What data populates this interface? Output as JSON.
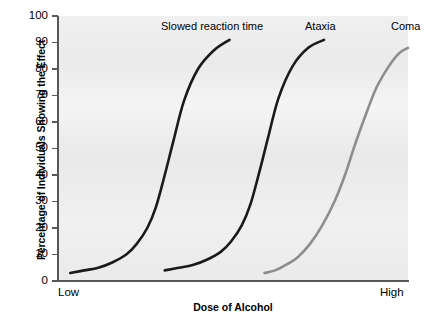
{
  "chart_data": {
    "type": "line",
    "title": "",
    "xlabel": "Dose of Alcohol",
    "ylabel": "Percentage of Individuals Showing the Effect",
    "xlim": [
      "Low",
      "High"
    ],
    "ylim": [
      0,
      100
    ],
    "grid": false,
    "legend_position": "inline-above-curves",
    "y_ticks": [
      0,
      10,
      20,
      30,
      40,
      50,
      60,
      70,
      80,
      90,
      100
    ],
    "y_tick_labels": [
      "0",
      "10",
      "20",
      "30",
      "40",
      "50",
      "60",
      "70",
      "80",
      "90",
      "100"
    ],
    "x_tick_labels": [
      "Low",
      "High"
    ],
    "colors": {
      "curve_black": "#1a1a1a",
      "curve_gray": "#8d8d8d",
      "panel_background": "#e8e8e8",
      "axis": "#585858",
      "text": "#000000"
    },
    "series": [
      {
        "name": "Slowed reaction time",
        "label": "Slowed reaction time",
        "color": "#1a1a1a",
        "x_fraction": [
          0.035,
          0.075,
          0.115,
          0.155,
          0.195,
          0.225,
          0.255,
          0.28,
          0.305,
          0.33,
          0.36,
          0.4,
          0.445,
          0.49
        ],
        "values": [
          3,
          4,
          5,
          7,
          10,
          14,
          20,
          28,
          40,
          53,
          68,
          80,
          87,
          91
        ]
      },
      {
        "name": "Ataxia",
        "label": "Ataxia",
        "color": "#1a1a1a",
        "x_fraction": [
          0.305,
          0.345,
          0.385,
          0.425,
          0.465,
          0.495,
          0.525,
          0.55,
          0.575,
          0.6,
          0.63,
          0.67,
          0.715,
          0.76
        ],
        "values": [
          4,
          5,
          6,
          8,
          11,
          15,
          21,
          29,
          41,
          54,
          69,
          81,
          88,
          91
        ]
      },
      {
        "name": "Coma",
        "label": "Coma",
        "color": "#8d8d8d",
        "x_fraction": [
          0.59,
          0.62,
          0.65,
          0.685,
          0.72,
          0.755,
          0.79,
          0.82,
          0.85,
          0.88,
          0.91,
          0.945,
          0.975,
          1.0
        ],
        "values": [
          3,
          4,
          6,
          9,
          14,
          21,
          30,
          40,
          52,
          63,
          73,
          81,
          86,
          88
        ]
      }
    ]
  },
  "axes": {
    "y_title": "Percentage of Individuals Showing the Effect",
    "x_title": "Dose of Alcohol",
    "x_low_label": "Low",
    "x_high_label": "High",
    "y_tick_labels": [
      "100",
      "90",
      "80",
      "70",
      "60",
      "50",
      "40",
      "30",
      "20",
      "10",
      "0"
    ]
  },
  "annotations": {
    "slowed": "Slowed reaction time",
    "ataxia": "Ataxia",
    "coma": "Coma"
  }
}
